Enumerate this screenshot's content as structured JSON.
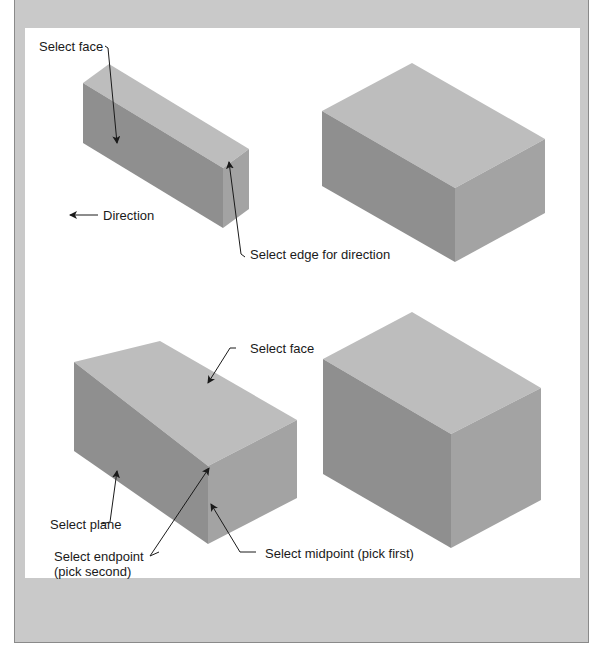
{
  "figure": {
    "colors": {
      "frame_bg": "#c9c9c9",
      "panel_bg": "#ffffff",
      "top_face": "#bdbdbd",
      "left_face": "#8f8f8f",
      "right_face": "#a3a3a3",
      "leader": "#1a1a1a"
    },
    "top_left": {
      "labels": {
        "select_face": "Select face",
        "direction": "Direction",
        "select_edge": "Select edge for direction"
      }
    },
    "top_right": {
      "labels": {}
    },
    "bottom_left": {
      "labels": {
        "select_face": "Select face",
        "select_plane": "Select plane",
        "select_endpoint_line1": "Select endpoint",
        "select_endpoint_line2": "(pick second)",
        "select_midpoint": "Select midpoint (pick first)"
      }
    },
    "bottom_right": {
      "labels": {}
    }
  }
}
